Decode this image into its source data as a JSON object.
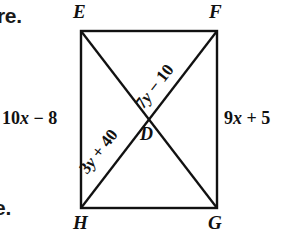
{
  "figure": {
    "type": "geometry-diagram",
    "shape": "rectangle-with-diagonals",
    "page_margin_text": {
      "top_fragment": "re.",
      "bottom_fragment": "e."
    },
    "vertices": {
      "top_left": "E",
      "top_right": "F",
      "bottom_left": "H",
      "bottom_right": "G",
      "intersection": "D"
    },
    "side_labels": {
      "left": {
        "coefficient": "10",
        "variable": "x",
        "operator": " − ",
        "constant": "8"
      },
      "right": {
        "coefficient": "9",
        "variable": "x",
        "operator": " + ",
        "constant": "5"
      }
    },
    "diagonal_labels": {
      "upper_segment": {
        "coefficient": "7",
        "variable": "y",
        "operator": " − ",
        "constant": "10"
      },
      "lower_segment": {
        "coefficient": "3",
        "variable": "y",
        "operator": " + ",
        "constant": "40"
      }
    },
    "colors": {
      "stroke": "#111111",
      "background": "#ffffff",
      "text": "#111111"
    },
    "geometry": {
      "rect_left": 81,
      "rect_top": 31,
      "rect_right": 217,
      "rect_bottom": 208,
      "center_x": 149,
      "center_y": 119.5,
      "stroke_width": 2.4
    }
  }
}
